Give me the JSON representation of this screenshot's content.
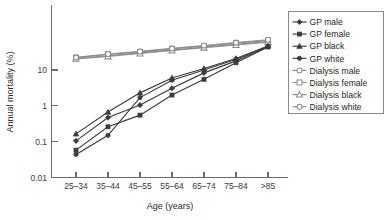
{
  "chart_data": {
    "type": "line",
    "title": "",
    "xlabel": "Age (years)",
    "ylabel": "Annual mortality (%)",
    "yscale": "log",
    "ylim": [
      0.01,
      100
    ],
    "ytick_labels": [
      "10",
      "1",
      "0.1",
      "0.01"
    ],
    "ytick_values": [
      10,
      1,
      0.1,
      0.01
    ],
    "grid": false,
    "legend_position": "right",
    "categories": [
      "25–34",
      "35–44",
      "45–55",
      "55–64",
      "65–74",
      "75–84",
      ">85"
    ],
    "series": [
      {
        "name": "GP male",
        "marker": "filled-diamond",
        "color": "#3b3b3b",
        "values": [
          0.105,
          0.47,
          1.05,
          3.1,
          8.3,
          18.0,
          45.0
        ]
      },
      {
        "name": "GP female",
        "marker": "filled-square",
        "color": "#3b3b3b",
        "values": [
          0.058,
          0.26,
          0.55,
          2.0,
          5.5,
          16.0,
          44.0
        ]
      },
      {
        "name": "GP black",
        "marker": "filled-triangle",
        "color": "#3b3b3b",
        "values": [
          0.165,
          0.67,
          2.3,
          6.0,
          11.0,
          21.0,
          47.0
        ]
      },
      {
        "name": "GP white",
        "marker": "filled-circle",
        "color": "#3b3b3b",
        "values": [
          0.044,
          0.15,
          1.7,
          5.2,
          10.0,
          20.0,
          46.0
        ]
      },
      {
        "name": "Dialysis male",
        "marker": "open-circle",
        "color": "#8d8d8d",
        "values": [
          21.0,
          25.0,
          30.0,
          36.0,
          43.0,
          52.0,
          62.0
        ]
      },
      {
        "name": "Dialysis female",
        "marker": "open-square",
        "color": "#8d8d8d",
        "values": [
          22.0,
          27.0,
          32.0,
          39.0,
          46.0,
          56.0,
          67.0
        ]
      },
      {
        "name": "Dialysis black",
        "marker": "open-triangle",
        "color": "#8d8d8d",
        "values": [
          20.5,
          24.0,
          29.0,
          35.0,
          42.0,
          50.0,
          60.0
        ]
      },
      {
        "name": "Dialysis white",
        "marker": "open-circle",
        "color": "#8d8d8d",
        "values": [
          22.5,
          28.0,
          33.0,
          40.0,
          48.0,
          58.0,
          70.0
        ]
      }
    ]
  },
  "legend": {
    "entries": [
      {
        "label": "GP male"
      },
      {
        "label": "GP female"
      },
      {
        "label": "GP black"
      },
      {
        "label": "GP white"
      },
      {
        "label": "Dialysis male"
      },
      {
        "label": "Dialysis female"
      },
      {
        "label": "Dialysis black"
      },
      {
        "label": "Dialysis white"
      }
    ]
  },
  "colors": {
    "gp": "#3b3b3b",
    "dialysis": "#8d8d8d",
    "axis": "#6b6b6b",
    "text": "#1f1f1f"
  }
}
